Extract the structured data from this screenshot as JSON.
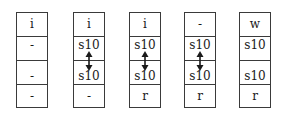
{
  "diagram": {
    "columns": [
      {
        "cells": [
          "i",
          "-",
          "-",
          "-"
        ],
        "arrow": false
      },
      {
        "cells": [
          "i",
          "s10",
          "s10",
          "-"
        ],
        "arrow": true
      },
      {
        "cells": [
          "i",
          "s10",
          "s10",
          "r"
        ],
        "arrow": true
      },
      {
        "cells": [
          "-",
          "s10",
          "s10",
          "r"
        ],
        "arrow": true
      },
      {
        "cells": [
          "w",
          "s10",
          "s10",
          "r"
        ],
        "arrow": false
      }
    ],
    "arrow_icon": "double-headed-vertical-arrow",
    "colors": {
      "border": "#3a3a3a",
      "text": "#1a1a1a",
      "background": "#ffffff"
    }
  }
}
